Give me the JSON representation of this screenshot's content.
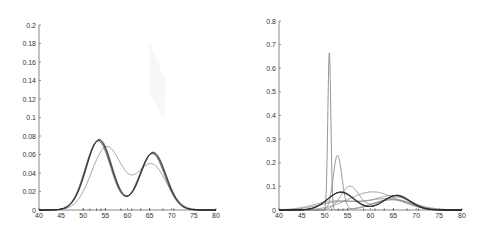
{
  "chart_data": [
    {
      "type": "line",
      "title": "",
      "xlabel": "",
      "ylabel": "",
      "xlim": [
        40,
        80
      ],
      "ylim": [
        0,
        0.2
      ],
      "x_ticks": [
        40,
        45,
        50,
        55,
        60,
        65,
        70,
        75,
        80
      ],
      "y_ticks": [
        0,
        0.02,
        0.04,
        0.06,
        0.08,
        0.1,
        0.12,
        0.14,
        0.16,
        0.18,
        0.2
      ],
      "y_tick_labels": [
        "0",
        "0.02",
        "0.04",
        "0.06",
        "0.08",
        "0.1",
        "0.12",
        "0.14",
        "0.16",
        "0.18",
        "0.2"
      ],
      "grid": false,
      "legend": null,
      "description": "Bimodal density estimates: dark band of many overlapping curves (peaks ~0.157 at x≈53.5 and ~0.123 at x≈65.5, trough ~0.033 at x≈59.5) plus one lighter curve (peaks ~0.138 at x≈55.5 and ~0.101 at x≈65, trough ~0.078 at x≈61)",
      "series": [
        {
          "name": "posterior-band",
          "color": "#222222",
          "width": 1.8,
          "components": [
            {
              "w": 0.55,
              "mu": 53.5,
              "sd": 2.9
            },
            {
              "w": 0.45,
              "mu": 65.7,
              "sd": 2.9
            }
          ],
          "peaks": [
            {
              "x": 53.5,
              "y": 0.157
            },
            {
              "x": 65.5,
              "y": 0.123
            }
          ],
          "trough": {
            "x": 59.5,
            "y": 0.033
          }
        },
        {
          "name": "single-estimate",
          "color": "#8a8a8a",
          "width": 0.9,
          "components": [
            {
              "w": 0.58,
              "mu": 55.3,
              "sd": 3.4
            },
            {
              "w": 0.42,
              "mu": 65.4,
              "sd": 3.4
            }
          ],
          "peaks": [
            {
              "x": 55.5,
              "y": 0.138
            },
            {
              "x": 65,
              "y": 0.101
            }
          ],
          "trough": {
            "x": 61,
            "y": 0.078
          }
        }
      ],
      "data_ticks_x": [
        50,
        51.5,
        53,
        54,
        55,
        58.5,
        61,
        63,
        65,
        68,
        70.5
      ]
    },
    {
      "type": "line",
      "title": "",
      "xlabel": "",
      "ylabel": "",
      "xlim": [
        40,
        80
      ],
      "ylim": [
        0,
        0.8
      ],
      "x_ticks": [
        40,
        45,
        50,
        55,
        60,
        65,
        70,
        75,
        80
      ],
      "y_ticks": [
        0,
        0.1,
        0.2,
        0.3,
        0.4,
        0.5,
        0.6,
        0.7,
        0.8
      ],
      "y_tick_labels": [
        "0",
        "0.1",
        "0.2",
        "0.3",
        "0.4",
        "0.5",
        "0.6",
        "0.7",
        "0.8"
      ],
      "grid": false,
      "legend": null,
      "description": "Several candidate density curves: narrow spike ~0.71 at x≈51, curve peaking ~0.23 at x≈52.8, dark bimodal curve (~0.16 at 53.5, ~0.12 at 65.5), and broad curves peaking ~0.12–0.14",
      "series": [
        {
          "name": "spike",
          "color": "#8a8a8a",
          "width": 0.9,
          "components": [
            {
              "w": 0.55,
              "mu": 51,
              "sd": 0.33
            },
            {
              "w": 0.45,
              "mu": 64.5,
              "sd": 4.2
            }
          ],
          "peaks": [
            {
              "x": 51,
              "y": 0.71
            }
          ]
        },
        {
          "name": "narrow-left",
          "color": "#8a8a8a",
          "width": 0.9,
          "components": [
            {
              "w": 0.55,
              "mu": 52.8,
              "sd": 0.95
            },
            {
              "w": 0.45,
              "mu": 64.8,
              "sd": 4.0
            }
          ],
          "peaks": [
            {
              "x": 52.8,
              "y": 0.23
            }
          ]
        },
        {
          "name": "posterior-band",
          "color": "#222222",
          "width": 1.8,
          "components": [
            {
              "w": 0.55,
              "mu": 53.5,
              "sd": 2.9
            },
            {
              "w": 0.45,
              "mu": 65.7,
              "sd": 2.9
            }
          ],
          "peaks": [
            {
              "x": 53.5,
              "y": 0.157
            },
            {
              "x": 65.5,
              "y": 0.123
            }
          ]
        },
        {
          "name": "mid-peak",
          "color": "#8a8a8a",
          "width": 0.9,
          "components": [
            {
              "w": 0.5,
              "mu": 55.5,
              "sd": 2.0
            },
            {
              "w": 0.5,
              "mu": 65.5,
              "sd": 3.6
            }
          ],
          "peaks": [
            {
              "x": 55.5,
              "y": 0.13
            }
          ]
        },
        {
          "name": "broad-unimodal",
          "color": "#8a8a8a",
          "width": 0.9,
          "components": [
            {
              "w": 1.0,
              "mu": 60.5,
              "sd": 5.2
            }
          ],
          "peaks": [
            {
              "x": 60.5,
              "y": 0.12
            }
          ]
        },
        {
          "name": "broad-bimodal",
          "color": "#8a8a8a",
          "width": 0.9,
          "components": [
            {
              "w": 0.45,
              "mu": 54,
              "sd": 5.0
            },
            {
              "w": 0.55,
              "mu": 65,
              "sd": 3.8
            }
          ],
          "peaks": [
            {
              "x": 65,
              "y": 0.1
            }
          ]
        },
        {
          "name": "wide-left",
          "color": "#8a8a8a",
          "width": 0.9,
          "components": [
            {
              "w": 0.4,
              "mu": 52,
              "sd": 4.5
            },
            {
              "w": 0.6,
              "mu": 64,
              "sd": 5.0
            }
          ],
          "peaks": [
            {
              "x": 63,
              "y": 0.075
            }
          ]
        }
      ],
      "data_ticks_x": [
        50,
        51.5,
        53,
        54,
        55,
        58.5,
        61,
        63,
        65,
        68,
        70.5
      ]
    }
  ],
  "panels": [
    {
      "name": "left-panel",
      "box": {
        "x0": 39,
        "x1": 216,
        "y0": 210,
        "y1": 25
      }
    },
    {
      "name": "right-panel",
      "box": {
        "x0": 279,
        "x1": 462,
        "y0": 210,
        "y1": 21
      }
    }
  ],
  "style": {
    "axis_color": "#555555",
    "tick_label_color": "#333333"
  }
}
